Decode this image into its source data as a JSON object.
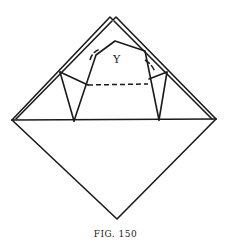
{
  "figure": {
    "label_y": "Y",
    "caption": "FIG. 150"
  },
  "colors": {
    "line": "#1a1a1a",
    "background": "#ffffff"
  }
}
